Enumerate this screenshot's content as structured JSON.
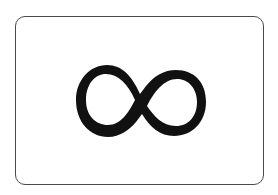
{
  "card": {
    "symbol": "infinity-icon",
    "symbol_glyph": "∞",
    "border_color": "#4a4a4a",
    "symbol_color": "#111111",
    "background_color": "#ffffff"
  }
}
